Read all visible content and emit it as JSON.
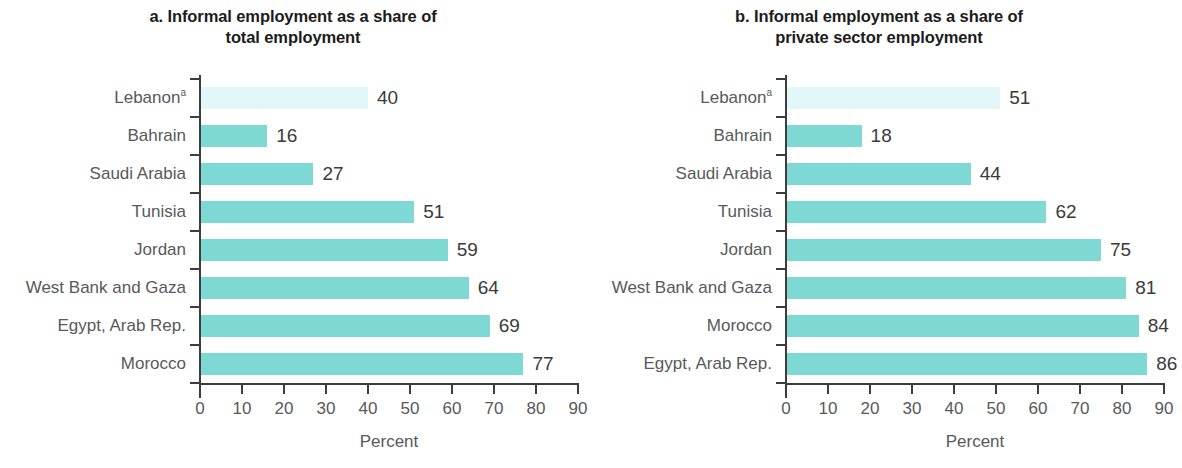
{
  "figure": {
    "panels": [
      {
        "id": "panel-a",
        "title_line1": "a. Informal employment as a share of",
        "title_line2": "total employment",
        "axis_title": "Percent",
        "categories": [
          "Lebanon",
          "Bahrain",
          "Saudi Arabia",
          "Tunisia",
          "Jordan",
          "West Bank and Gaza",
          "Egypt, Arab Rep.",
          "Morocco"
        ],
        "footnote_marker_index": 0,
        "footnote_marker": "a",
        "values": [
          40,
          16,
          27,
          51,
          59,
          64,
          69,
          77
        ],
        "value_labels": [
          "40",
          "16",
          "27",
          "51",
          "59",
          "64",
          "69",
          "77"
        ],
        "tick_labels": [
          "0",
          "10",
          "20",
          "30",
          "40",
          "50",
          "60",
          "70",
          "80",
          "90"
        ]
      },
      {
        "id": "panel-b",
        "title_line1": "b. Informal employment as a share of",
        "title_line2": "private sector employment",
        "axis_title": "Percent",
        "categories": [
          "Lebanon",
          "Bahrain",
          "Saudi Arabia",
          "Tunisia",
          "Jordan",
          "West Bank and Gaza",
          "Morocco",
          "Egypt, Arab Rep."
        ],
        "footnote_marker_index": 0,
        "footnote_marker": "a",
        "values": [
          51,
          18,
          44,
          62,
          75,
          81,
          84,
          86
        ],
        "value_labels": [
          "51",
          "18",
          "44",
          "62",
          "75",
          "81",
          "84",
          "86"
        ],
        "tick_labels": [
          "0",
          "10",
          "20",
          "30",
          "40",
          "50",
          "60",
          "70",
          "80",
          "90"
        ]
      }
    ]
  },
  "colors": {
    "bar": "#7ed9d5",
    "bar_highlight": "#e2f8f8",
    "axis": "#3d3d3d",
    "label_text": "#58595b",
    "title_text": "#1c1c1c",
    "value_text": "#3b3b3b",
    "background": "#ffffff"
  },
  "chart_data": [
    {
      "type": "bar",
      "orientation": "horizontal",
      "title": "a. Informal employment as a share of total employment",
      "xlabel": "Percent",
      "ylabel": "",
      "xlim": [
        0,
        90
      ],
      "xticks": [
        0,
        10,
        20,
        30,
        40,
        50,
        60,
        70,
        80,
        90
      ],
      "grid": false,
      "legend": "none",
      "data_labels": true,
      "categories": [
        "Lebanon",
        "Bahrain",
        "Saudi Arabia",
        "Tunisia",
        "Jordan",
        "West Bank and Gaza",
        "Egypt, Arab Rep.",
        "Morocco"
      ],
      "values": [
        40,
        16,
        27,
        51,
        59,
        64,
        69,
        77
      ],
      "highlighted_categories": [
        "Lebanon"
      ],
      "notes": [
        "Lebanon carries footnote marker a"
      ]
    },
    {
      "type": "bar",
      "orientation": "horizontal",
      "title": "b. Informal employment as a share of private sector employment",
      "xlabel": "Percent",
      "ylabel": "",
      "xlim": [
        0,
        90
      ],
      "xticks": [
        0,
        10,
        20,
        30,
        40,
        50,
        60,
        70,
        80,
        90
      ],
      "grid": false,
      "legend": "none",
      "data_labels": true,
      "categories": [
        "Lebanon",
        "Bahrain",
        "Saudi Arabia",
        "Tunisia",
        "Jordan",
        "West Bank and Gaza",
        "Morocco",
        "Egypt, Arab Rep."
      ],
      "values": [
        51,
        18,
        44,
        62,
        75,
        81,
        84,
        86
      ],
      "highlighted_categories": [
        "Lebanon"
      ],
      "notes": [
        "Lebanon carries footnote marker a"
      ]
    }
  ]
}
